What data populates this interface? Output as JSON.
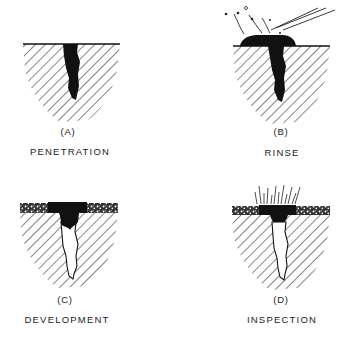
{
  "figure": {
    "panels": [
      {
        "id": "A",
        "label": "(A)",
        "caption": "PENETRATION"
      },
      {
        "id": "B",
        "label": "(B)",
        "caption": "RINSE"
      },
      {
        "id": "C",
        "label": "(C)",
        "caption": "DEVELOPMENT"
      },
      {
        "id": "D",
        "label": "(D)",
        "caption": "INSPECTION"
      }
    ],
    "colors": {
      "ink": "#111111",
      "background": "#ffffff"
    }
  }
}
